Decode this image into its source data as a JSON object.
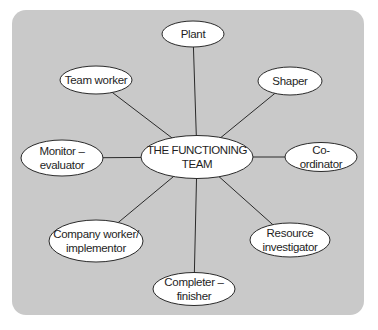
{
  "diagram": {
    "type": "hub-and-spoke",
    "background_color": "#c9c9c9",
    "node_fill": "#ffffff",
    "stroke_color": "#2a2a2a",
    "center": {
      "label": "THE FUNCTIONING\nTEAM",
      "cx": 197,
      "cy": 157,
      "rx": 56,
      "ry": 21.5
    },
    "nodes": [
      {
        "id": "plant",
        "label": "Plant",
        "cx": 193,
        "cy": 34,
        "rx": 31,
        "ry": 13
      },
      {
        "id": "shaper",
        "label": "Shaper",
        "cx": 290,
        "cy": 81,
        "rx": 32,
        "ry": 14
      },
      {
        "id": "co-ordinator",
        "label": "Co-ordinator",
        "cx": 321,
        "cy": 157,
        "rx": 36,
        "ry": 14.5
      },
      {
        "id": "resource-investigator",
        "label": "Resource\ninvestigator",
        "cx": 290,
        "cy": 240,
        "rx": 40,
        "ry": 17
      },
      {
        "id": "completer-finisher",
        "label": "Completer –\nfinisher",
        "cx": 194,
        "cy": 289,
        "rx": 41,
        "ry": 16.5
      },
      {
        "id": "company-worker-implementor",
        "label": "Company worker/\nimplementor",
        "cx": 96,
        "cy": 241,
        "rx": 47,
        "ry": 21
      },
      {
        "id": "monitor-evaluator",
        "label": "Monitor –\nevaluator",
        "cx": 62,
        "cy": 158,
        "rx": 41,
        "ry": 18
      },
      {
        "id": "team-worker",
        "label": "Team worker",
        "cx": 96,
        "cy": 80,
        "rx": 36,
        "ry": 14
      }
    ]
  }
}
